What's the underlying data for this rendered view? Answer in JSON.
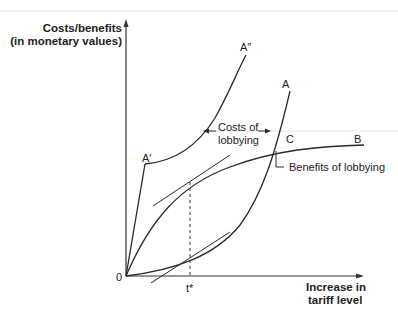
{
  "diagram": {
    "y_axis_label": [
      "Costs/benefits",
      "(in monetary values)"
    ],
    "x_axis_label": [
      "Increase in",
      "tariff level"
    ],
    "origin_label": "0",
    "t_star_label": "t*",
    "curve_labels": {
      "A": "A",
      "A_double_prime": "A″",
      "A_prime": "A′",
      "B": "B",
      "C": "C"
    },
    "annotations": {
      "costs_of_lobbying": [
        "Costs of",
        "lobbying"
      ],
      "benefits_of_lobbying": "Benefits of lobbying"
    }
  }
}
